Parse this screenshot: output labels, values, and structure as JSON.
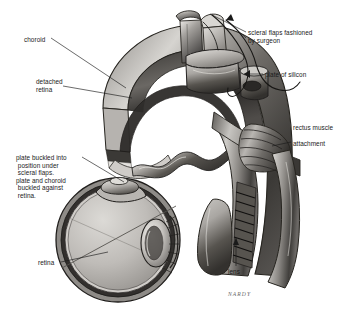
{
  "figure": {
    "style": "grayscale airbrush medical illustration",
    "background_color": "#ffffff",
    "ink_color": "#1a1a1a",
    "width": 351,
    "height": 317
  },
  "labels": {
    "choroid": "choroid",
    "detached_retina": "detached\nretina",
    "scleral_flaps": "scleral flaps fashioned\nby surgeon",
    "plate_of_silicon": "plate of silicon",
    "rectus_muscle": "rectus muscle",
    "attachment": "attachment",
    "plate_buckled": "plate buckled into\n position under\n scleral flaps.\nplate and choroid\n buckled against\n retina.",
    "retina": "retina",
    "lens": "lens"
  },
  "signature": {
    "text": "NARDY"
  },
  "anatomy": {
    "upper_view": "cutaway of eye wall arch showing sclera, choroid and detached retina with silicone plate secured under scleral flaps and encircling band at rectus muscle attachment",
    "lower_view": "sagittal cross-section of globe with lens, retina and buckled plate indenting the wall"
  },
  "palette": {
    "paper": "#ffffff",
    "ink": "#1a1a1a",
    "tissue_light": "#d8d6d2",
    "tissue_mid": "#9b9894",
    "tissue_dark": "#4a4844",
    "tissue_shadow": "#2a2826",
    "highlight": "#f2f0ec",
    "signature_gray": "#6a6a6a"
  }
}
